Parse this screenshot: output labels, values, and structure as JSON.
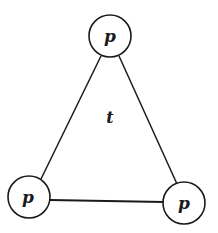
{
  "diagram": {
    "type": "triangle-graph",
    "center_label": "t",
    "nodes": [
      {
        "id": "top",
        "label": "p",
        "cx": 110,
        "cy": 36,
        "r": 21
      },
      {
        "id": "bottom-left",
        "label": "p",
        "cx": 29,
        "cy": 197,
        "r": 21
      },
      {
        "id": "bottom-right",
        "label": "p",
        "cx": 184,
        "cy": 203,
        "r": 21
      }
    ],
    "edges": [
      {
        "from": "top",
        "to": "bottom-left"
      },
      {
        "from": "top",
        "to": "bottom-right"
      },
      {
        "from": "bottom-left",
        "to": "bottom-right"
      }
    ],
    "colors": {
      "stroke": "#1a1a1a",
      "background": "#ffffff"
    }
  }
}
